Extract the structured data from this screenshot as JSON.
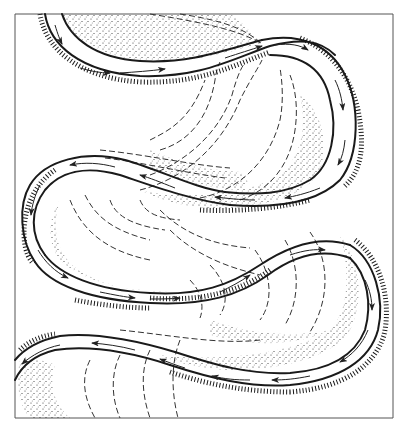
{
  "figure": {
    "description": "Meandering river channel with point bars and flow arrows",
    "elements": {
      "channel": "meandering river channel (double line banks)",
      "cut_banks": "hachured outer banks",
      "point_bars": "stippled inner-bank deposits",
      "scroll_lines": "dashed accretion lines",
      "flow_arrows": "arrows showing flow direction along channel"
    },
    "colors": {
      "ink": "#1a1a1a",
      "background": "#ffffff",
      "frame": "#555555"
    }
  }
}
